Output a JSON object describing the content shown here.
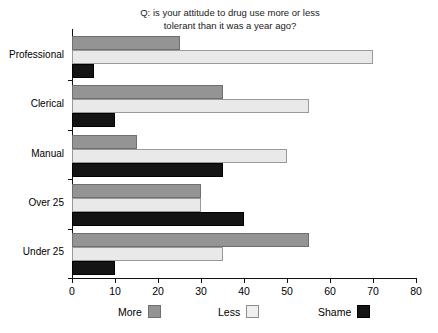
{
  "chart_data": {
    "type": "bar",
    "orientation": "horizontal",
    "title": "Q: is your attitude to drug use more or less\ntolerant than it was a year ago?",
    "xlabel": "",
    "ylabel": "",
    "xlim": [
      0,
      80
    ],
    "xticks": [
      0,
      10,
      20,
      30,
      40,
      50,
      60,
      70,
      80
    ],
    "grid": false,
    "legend_position": "bottom",
    "categories": [
      "Professional",
      "Clerical",
      "Manual",
      "Over 25",
      "Under 25"
    ],
    "series": [
      {
        "name": "More",
        "color": "#949494",
        "values": [
          25,
          35,
          15,
          30,
          55
        ]
      },
      {
        "name": "Less",
        "color": "#e9e9e9",
        "values": [
          70,
          55,
          50,
          30,
          35
        ]
      },
      {
        "name": "Shame",
        "color": "#141414",
        "values": [
          5,
          10,
          35,
          40,
          10
        ]
      }
    ]
  },
  "legend": {
    "items": [
      {
        "label": "More",
        "swatch": "more"
      },
      {
        "label": "Less",
        "swatch": "less"
      },
      {
        "label": "Shame",
        "swatch": "shame"
      }
    ]
  },
  "axis": {
    "tick_labels": [
      "0",
      "10",
      "20",
      "30",
      "40",
      "50",
      "60",
      "70",
      "80"
    ]
  },
  "categories": {
    "labels": [
      "Professional",
      "Clerical",
      "Manual",
      "Over 25",
      "Under 25"
    ]
  }
}
